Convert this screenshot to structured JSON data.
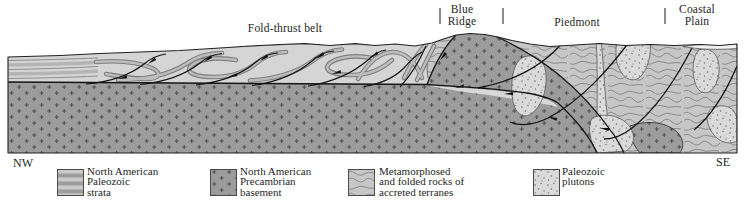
{
  "figure": {
    "region_labels": {
      "fold_thrust_belt": "Fold-thrust belt",
      "blue_ridge": {
        "line1": "Blue",
        "line2": "Ridge"
      },
      "piedmont": "Piedmont",
      "coastal_plain": {
        "line1": "Coastal",
        "line2": "Plain"
      }
    },
    "direction_labels": {
      "northwest": "NW",
      "southeast": "SE"
    }
  },
  "legend": {
    "items": [
      {
        "id": "north-american-paleozoic-strata",
        "pattern": "horizontal-stripes",
        "lines": [
          "North American",
          "Paleozoic",
          "strata"
        ]
      },
      {
        "id": "north-american-precambrian-basement",
        "pattern": "plus-marks",
        "lines": [
          "North American",
          "Precambrian",
          "basement"
        ]
      },
      {
        "id": "metamorphosed-accreted-terranes",
        "pattern": "contour-squiggles",
        "lines": [
          "Metamorphosed",
          "and folded rocks of",
          "accreted terranes"
        ]
      },
      {
        "id": "paleozoic-plutons",
        "pattern": "fine-dots",
        "lines": [
          "Paleozoic",
          "plutons"
        ]
      }
    ]
  },
  "colors": {
    "background": "#ffffff",
    "strata_light_gray": "#d5d5d5",
    "strata_band_gray": "#7e7e7e",
    "strata_band_light": "#bdbdbd",
    "basement_gray": "#9c9c9c",
    "basement_plus_mark": "#454545",
    "metamorphic_gray": "#c7c7c7",
    "metamorphic_squiggle": "#8b8b8b",
    "pluton_gray": "#dadada",
    "pluton_dot": "#6f6f6f",
    "coastal_wedge": "#f1f1ef",
    "fault_line": "#151515",
    "outline": "#222222",
    "tick_gray": "#8c8c8c",
    "text": "#262626"
  }
}
